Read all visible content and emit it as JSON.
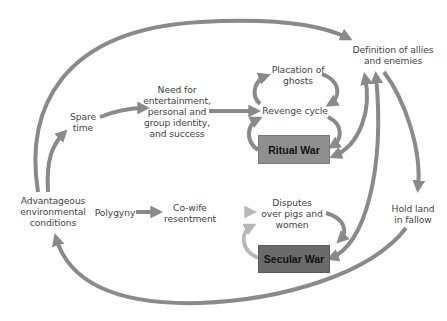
{
  "diagram": {
    "type": "causal-flow",
    "colors": {
      "arrow": "#8a8a8a",
      "ritual_box": "#8f8f8f",
      "secular_box": "#6a6a6a",
      "text": "#444444"
    },
    "nodes": {
      "definition": {
        "line1": "Definition of allies",
        "line2": "and enemies"
      },
      "placation": {
        "line1": "Placation of",
        "line2": "ghosts"
      },
      "revenge": {
        "line1": "Revenge cycle"
      },
      "need": {
        "line1": "Need for",
        "line2": "entertainment,",
        "line3": "personal and",
        "line4": "group identity,",
        "line5": "and success"
      },
      "spare_time": {
        "line1": "Spare",
        "line2": "time"
      },
      "ritual_war": {
        "label": "Ritual War"
      },
      "advantageous": {
        "line1": "Advantageous",
        "line2": "environmental",
        "line3": "conditions"
      },
      "polygyny": {
        "line1": "Polygyny"
      },
      "cowife": {
        "line1": "Co-wife",
        "line2": "resentment"
      },
      "disputes": {
        "line1": "Disputes",
        "line2": "over pigs and",
        "line3": "women"
      },
      "hold_land": {
        "line1": "Hold land",
        "line2": "in fallow"
      },
      "secular_war": {
        "label": "Secular War"
      }
    },
    "edges": [
      {
        "from": "Advantageous environmental conditions",
        "to": "Definition of allies and enemies"
      },
      {
        "from": "Advantageous environmental conditions",
        "to": "Spare time"
      },
      {
        "from": "Spare time",
        "to": "Need for entertainment, personal and group identity, and success"
      },
      {
        "from": "Need for entertainment, personal and group identity, and success",
        "to": "Revenge cycle"
      },
      {
        "from": "Revenge cycle",
        "to": "Placation of ghosts"
      },
      {
        "from": "Placation of ghosts",
        "to": "Revenge cycle"
      },
      {
        "from": "Revenge cycle",
        "to": "Ritual War"
      },
      {
        "from": "Ritual War",
        "to": "Revenge cycle"
      },
      {
        "from": "Ritual War",
        "to": "Definition of allies and enemies"
      },
      {
        "from": "Definition of allies and enemies",
        "to": "Ritual War"
      },
      {
        "from": "Secular War",
        "to": "Definition of allies and enemies"
      },
      {
        "from": "Definition of allies and enemies",
        "to": "Secular War"
      },
      {
        "from": "Definition of allies and enemies",
        "to": "Hold land in fallow"
      },
      {
        "from": "Hold land in fallow",
        "to": "Advantageous environmental conditions"
      },
      {
        "from": "Polygyny",
        "to": "Co-wife resentment"
      },
      {
        "from": "Co-wife resentment",
        "to": "Disputes over pigs and women"
      },
      {
        "from": "Disputes over pigs and women",
        "to": "Secular War"
      },
      {
        "from": "Secular War",
        "to": "Disputes over pigs and women"
      }
    ]
  }
}
